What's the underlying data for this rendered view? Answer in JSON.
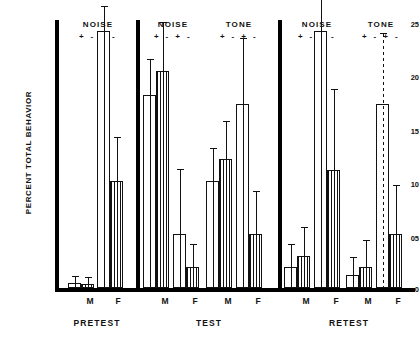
{
  "chart_data": {
    "type": "bar",
    "title": "",
    "xlabel": "",
    "ylabel": "PERCENT TOTAL BEHAVIOR",
    "ylim": [
      0,
      25
    ],
    "yticks": [
      "0",
      "05",
      "10",
      "15",
      "20",
      "25"
    ],
    "ytick_values": [
      0,
      5,
      10,
      15,
      20,
      25
    ],
    "grid": false,
    "legend": "none",
    "stimulus_signs": "+ - + -",
    "phases": [
      "PRETEST",
      "TEST",
      "RETEST"
    ],
    "sex_labels": [
      "M",
      "F"
    ],
    "stimulus_groups": [
      "NOISE",
      "TONE"
    ],
    "series": [
      {
        "name": "plus (open bar)",
        "fill": "open"
      },
      {
        "name": "minus (hatched bar)",
        "fill": "hatched"
      }
    ],
    "panels": [
      {
        "phase": "PRETEST",
        "groups": [
          {
            "stimulus": "NOISE",
            "sexes": [
              {
                "sex": "M",
                "bars": [
                  {
                    "sign": "+",
                    "fill": "open",
                    "value": 0.5,
                    "error": 0.5
                  },
                  {
                    "sign": "-",
                    "fill": "hatched",
                    "value": 0.4,
                    "error": 0.5
                  }
                ]
              },
              {
                "sex": "F",
                "bars": [
                  {
                    "sign": "+",
                    "fill": "open",
                    "value": 24.0,
                    "error": 2.2
                  },
                  {
                    "sign": "-",
                    "fill": "hatched",
                    "value": 10.0,
                    "error": 4.0
                  }
                ]
              }
            ]
          }
        ]
      },
      {
        "phase": "TEST",
        "groups": [
          {
            "stimulus": "NOISE",
            "sexes": [
              {
                "sex": "M",
                "bars": [
                  {
                    "sign": "+",
                    "fill": "open",
                    "value": 18.0,
                    "error": 3.3
                  },
                  {
                    "sign": "-",
                    "fill": "hatched",
                    "value": 20.2,
                    "error": 4.5
                  }
                ]
              },
              {
                "sex": "F",
                "bars": [
                  {
                    "sign": "+",
                    "fill": "open",
                    "value": 5.0,
                    "error": 6.0
                  },
                  {
                    "sign": "-",
                    "fill": "hatched",
                    "value": 2.0,
                    "error": 2.0
                  }
                ]
              }
            ]
          },
          {
            "stimulus": "TONE",
            "sexes": [
              {
                "sex": "M",
                "bars": [
                  {
                    "sign": "+",
                    "fill": "open",
                    "value": 10.0,
                    "error": 3.0
                  },
                  {
                    "sign": "-",
                    "fill": "hatched",
                    "value": 12.0,
                    "error": 3.5
                  }
                ]
              },
              {
                "sex": "F",
                "bars": [
                  {
                    "sign": "+",
                    "fill": "open",
                    "value": 17.2,
                    "error": 6.0
                  },
                  {
                    "sign": "-",
                    "fill": "hatched",
                    "value": 5.0,
                    "error": 4.0
                  }
                ]
              }
            ]
          }
        ]
      },
      {
        "phase": "RETEST",
        "groups": [
          {
            "stimulus": "NOISE",
            "sexes": [
              {
                "sex": "M",
                "bars": [
                  {
                    "sign": "+",
                    "fill": "open",
                    "value": 2.0,
                    "error": 2.0
                  },
                  {
                    "sign": "-",
                    "fill": "hatched",
                    "value": 3.0,
                    "error": 2.6
                  }
                ]
              },
              {
                "sex": "F",
                "bars": [
                  {
                    "sign": "+",
                    "fill": "open",
                    "value": 24.0,
                    "error": 8.5
                  },
                  {
                    "sign": "-",
                    "fill": "hatched",
                    "value": 11.0,
                    "error": 7.5
                  }
                ]
              }
            ]
          },
          {
            "stimulus": "TONE",
            "sexes": [
              {
                "sex": "M",
                "bars": [
                  {
                    "sign": "+",
                    "fill": "open",
                    "value": 1.2,
                    "error": 1.6
                  },
                  {
                    "sign": "-",
                    "fill": "hatched",
                    "value": 2.0,
                    "error": 2.4
                  }
                ]
              },
              {
                "sex": "F",
                "bars": [
                  {
                    "sign": "+",
                    "fill": "open",
                    "value": 17.2,
                    "error": 6.5
                  },
                  {
                    "sign": "-",
                    "fill": "hatched",
                    "value": 5.0,
                    "error": 4.5
                  }
                ]
              }
            ]
          }
        ]
      }
    ]
  },
  "axis": {
    "ylabel": "PERCENT TOTAL BEHAVIOR",
    "tick_25": "25",
    "tick_20": "20",
    "tick_15": "15",
    "tick_10": "10",
    "tick_05": "05",
    "tick_0": "0"
  },
  "headers": {
    "noise": "NOISE",
    "tone": "TONE",
    "signs": "+ - + -"
  },
  "phase_labels": {
    "pretest": "PRETEST",
    "test": "TEST",
    "retest": "RETEST"
  },
  "sex": {
    "male": "M",
    "female": "F"
  },
  "colors": {
    "ink": "#111111",
    "background": "#ffffff"
  }
}
